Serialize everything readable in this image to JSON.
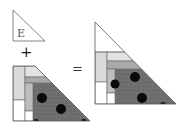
{
  "diagram": {
    "small_piece": {
      "label": "E"
    },
    "operators": {
      "plus": "+",
      "equals": "="
    },
    "colors": {
      "outline": "#555555",
      "light_gray": "#e2e2e2",
      "strip_gray": "#dadada",
      "mid_gray": "#a9a9a9",
      "column_gray": "#bdbdbd",
      "dark_gray": "#6e6e6e",
      "dot": "#0a0a0a",
      "white": "#ffffff"
    }
  }
}
